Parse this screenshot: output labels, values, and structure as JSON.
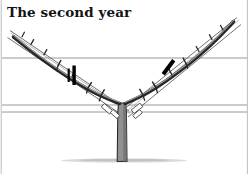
{
  "figure": {
    "title": "The second year",
    "domain_subject": "pruning-diagram",
    "background_color": "#ffffff",
    "ink_color": "#1a1a1a",
    "trunk_fill_color": "#8f8f8f",
    "trunk_shade_color": "#6d6d6d",
    "wire_color": "#8a8a8a",
    "rail_color": "#4a4a4a",
    "cut_mark_color": "#000000",
    "ground_color": "#cfcfcf",
    "border_color": "#b9b9b9"
  },
  "canvas": {
    "width": 249,
    "height": 174
  },
  "borders": {
    "left_x": 1,
    "right_x": 247,
    "top_y": 0,
    "bottom_y": 174,
    "label_left": "left-frame-rule",
    "label_right": "right-frame-rule"
  },
  "ground": {
    "y": 160,
    "x_start": 62,
    "x_end": 190,
    "label": "ground-line"
  },
  "trunk": {
    "label": "central-trunk",
    "base_x": 122,
    "base_y": 161,
    "top_y": 100,
    "half_width_bottom": 5.2,
    "half_width_top": 4.2,
    "crotch_y": 101
  },
  "wires": [
    {
      "name": "upper-trellis-wire",
      "y": 58,
      "x_start": 2,
      "x_end": 247
    },
    {
      "name": "lower-trellis-wire-1",
      "y": 105,
      "x_start": 2,
      "x_end": 247
    },
    {
      "name": "lower-trellis-wire-2",
      "y": 112,
      "x_start": 2,
      "x_end": 247
    }
  ],
  "arms": [
    {
      "name": "left-arm",
      "side": "left",
      "start_x": 120,
      "start_y": 101,
      "end_x": 13,
      "end_y": 30,
      "thickness": 3.6
    },
    {
      "name": "right-arm",
      "side": "right",
      "start_x": 126,
      "start_y": 101,
      "end_x": 233,
      "end_y": 19,
      "thickness": 3.6
    }
  ],
  "rails": [
    {
      "name": "left-rail-upper",
      "x1": 10,
      "y1": 31,
      "x2": 128,
      "y2": 111
    },
    {
      "name": "left-rail-lower",
      "x1": 8,
      "y1": 38,
      "x2": 124,
      "y2": 116
    },
    {
      "name": "right-rail-upper",
      "x1": 236,
      "y1": 18,
      "x2": 124,
      "y2": 110
    },
    {
      "name": "right-rail-lower",
      "x1": 240,
      "y1": 25,
      "x2": 128,
      "y2": 116
    }
  ],
  "cut_marks": [
    {
      "name": "left-pruning-cut-mark",
      "x": 74,
      "y": 75,
      "angle_deg": 0,
      "width": 3.4,
      "height": 20
    },
    {
      "name": "right-pruning-cut-mark",
      "x": 168,
      "y": 67,
      "angle_deg": 37,
      "width": 4.0,
      "height": 17
    }
  ],
  "ties": [
    {
      "name": "tie-left-lower",
      "x": 105,
      "y": 111,
      "angle_deg": 40
    },
    {
      "name": "tie-right-lower",
      "x": 140,
      "y": 109,
      "angle_deg": -38
    },
    {
      "name": "tie-left-inner",
      "x": 112,
      "y": 108,
      "angle_deg": 42
    },
    {
      "name": "tie-right-inner",
      "x": 134,
      "y": 107,
      "angle_deg": -40
    }
  ],
  "spurs": {
    "label": "lateral-spurs",
    "count_left": 7,
    "count_right": 7,
    "description": "short side shoots along each arm"
  }
}
